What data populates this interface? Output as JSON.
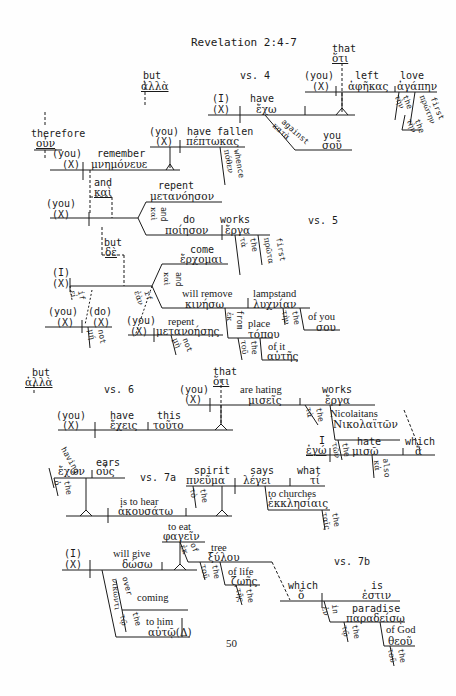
{
  "title": "Revelation 2:4-7",
  "page_number": "50",
  "verse_labels": {
    "v4": "vs. 4",
    "v5": "vs. 5",
    "v6": "vs. 6",
    "v7a": "vs. 7a",
    "v7b": "vs. 7b"
  },
  "v4": {
    "but_en": "but",
    "but_gr": "ἀλλὰ",
    "subj_en": "(I)",
    "subj_x": "(X)",
    "verb_en": "have",
    "verb_gr": "ἔχω",
    "that_en": "that",
    "that_gr": "ὅτι",
    "you_en": "(you)",
    "you_x": "(X)",
    "left_en": "left",
    "left_gr": "ἀφῆκας",
    "love_en": "love",
    "love_gr": "ἀγάπην",
    "the1": "the",
    "the1_gr": "τὴν",
    "first_en": "first",
    "first_gr": "πρώτην",
    "the2": "the",
    "the2_gr": "τὴν",
    "against_en": "against",
    "against_gr": "κατὰ",
    "you2_en": "you",
    "you2_gr": "σοῦ"
  },
  "v5": {
    "therefore_en": "therefore",
    "therefore_gr": "οὖν",
    "you_en": "(you)",
    "you_x": "(X)",
    "remember_en": "remember",
    "remember_gr": "μνημόνευε",
    "you2_en": "(you)",
    "you2_x": "(X)",
    "fallen_en": "have fallen",
    "fallen_gr": "πέπτωκας",
    "whence_en": "whence",
    "whence_gr": "πόθεν",
    "and_en": "and",
    "and_gr": "καὶ",
    "you3_en": "(you)",
    "you3_x": "(X)",
    "repent_en": "repent",
    "repent_gr": "μετανόησον",
    "and2_en": "and",
    "and2_gr": "καὶ",
    "do_en": "do",
    "do_gr": "ποίησον",
    "works_en": "works",
    "works_gr": "ἔργα",
    "the_en": "the",
    "the_gr": "τὰ",
    "first_en": "first",
    "first_gr": "πρῶτα",
    "but_en": "but",
    "but_gr": "δὲ",
    "i_en": "(I)",
    "i_x": "(X)",
    "come_en": "come",
    "come_gr": "ἔρχομαι",
    "and3_en": "and",
    "and3_gr": "καὶ",
    "remove_en": "will remove",
    "remove_gr": "κινήσω",
    "lampstand_en": "lampstand",
    "lampstand_gr": "λυχνίαν",
    "the3_en": "the",
    "the3_gr": "τὴν",
    "ofyou_en": "of you",
    "ofyou_gr": "σου",
    "from_en": "from",
    "from_gr": "ἐκ",
    "place_en": "place",
    "place_gr": "τόπου",
    "the4_en": "the",
    "the4_gr": "τοῦ",
    "ofit_en": "of it",
    "ofit_gr": "αὐτῆς",
    "if_en": "if",
    "if_gr": "ἐὰν",
    "you4_en": "(you)",
    "you4_x": "(X)",
    "repent2_en": "repent",
    "repent2_gr": "μετανοήσῃς",
    "not_en": "not",
    "not_gr": "μὴ",
    "if2_en": "if",
    "if2_gr": "εἰ",
    "you5_en": "(you)",
    "you5_x": "(X)",
    "do2_en": "(do)",
    "do2_x": "(X)",
    "not2_en": "not",
    "not2_gr": "μή"
  },
  "v6": {
    "but_en": "but",
    "but_gr": "ἀλλὰ",
    "you_en": "(you)",
    "you_x": "(X)",
    "have_en": "have",
    "have_gr": "ἔχεις",
    "this_en": "this",
    "this_gr": "τοῦτο",
    "that_en": "that",
    "that_gr": "ὅτι",
    "you2_en": "(you)",
    "you2_x": "(X)",
    "hating_en": "are hating",
    "hating_gr": "μισεῖς",
    "works_en": "works",
    "works_gr": "ἔργα",
    "the_en": "the",
    "the_gr": "τὰ",
    "nic_en": "Nicolaitans",
    "nic_gr": "Νικολαϊτῶν",
    "the2_en": "the",
    "the2_gr": "τῶν",
    "i_en": "I",
    "i_gr": "ἐγώ",
    "hate_en": "hate",
    "hate_gr": "μισῶ",
    "which_en": "which",
    "which_gr": "ἃ",
    "also_en": "also",
    "also_gr": "κἀ"
  },
  "v7a": {
    "having_en": "having",
    "having_gr": "ἔχων",
    "ears_en": "ears",
    "ears_gr": "οὖς",
    "the_en": "the",
    "the_gr": "ὁ",
    "hear_en": "is to hear",
    "hear_gr": "ἀκουσάτω",
    "spirit_en": "spirit",
    "spirit_gr": "πνεῦμα",
    "the2_en": "the",
    "the2_gr": "τὸ",
    "says_en": "says",
    "says_gr": "λέγει",
    "what_en": "what",
    "what_gr": "τί",
    "churches_en": "to churches",
    "churches_gr": "ἐκκλησίαις",
    "the3_en": "the",
    "the3_gr": "ταῖς"
  },
  "v7b": {
    "i_en": "(I)",
    "i_x": "(X)",
    "give_en": "will give",
    "give_gr": "δώσω",
    "eat_en": "to eat",
    "eat_gr": "φαγεῖν",
    "of_en": "of",
    "of_gr": "ἐκ",
    "tree_en": "tree",
    "tree_gr": "ξύλου",
    "the_en": "the",
    "the_gr": "τοῦ",
    "life_en": "of life",
    "life_gr": "ζωῆς",
    "the2_en": "the",
    "the2_gr": "τῆς",
    "over_en": "over",
    "over_gr": "νικῶντι",
    "coming_en": "coming",
    "the3_en": "the",
    "the3_gr": "τῷ",
    "him_en": "to him",
    "him_gr": "αὐτῷ(Δ)",
    "which_en": "which",
    "which_gr": "ὅ",
    "is_en": "is",
    "is_gr": "ἐστιν",
    "in_en": "in",
    "in_gr": "ἐν",
    "paradise_en": "paradise",
    "paradise_gr": "παραδείσῳ",
    "the4_en": "the",
    "the4_gr": "τῷ",
    "god_en": "of God",
    "god_gr": "θεοῦ",
    "the5_en": "the",
    "the5_gr": "τοῦ"
  }
}
